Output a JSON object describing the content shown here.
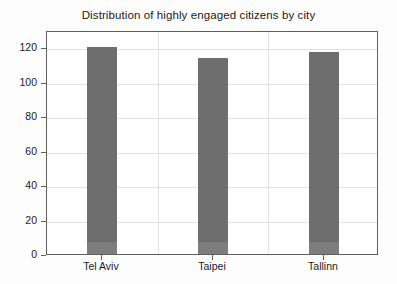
{
  "chart_data": {
    "type": "bar",
    "title": "Distribution of highly engaged citizens by city",
    "xlabel": "",
    "ylabel": "",
    "categories": [
      "Tel Aviv",
      "Taipei",
      "Tallinn"
    ],
    "values": [
      120,
      114,
      117
    ],
    "ylim": [
      0,
      130
    ],
    "yticks": [
      0,
      20,
      40,
      60,
      80,
      100,
      120
    ],
    "ytick_labels": [
      "0",
      "20",
      "40",
      "60",
      "80",
      "100",
      "120"
    ],
    "grid": true,
    "legend": null,
    "bar_color": "#6e6e6e",
    "frame_color": "#5f5f5f",
    "grid_color": "#e2e2e2",
    "background": "#ffffff"
  }
}
